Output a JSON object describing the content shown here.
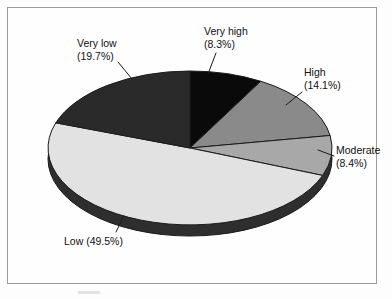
{
  "figure": {
    "background_color": "#fdfdfd",
    "frame_color": "#9a9a9a",
    "text_color": "#111111"
  },
  "chart_data": {
    "type": "pie",
    "title": "",
    "subtitle": "",
    "xlabel": "",
    "ylabel": "",
    "legend_position": "none",
    "grid": false,
    "three_d": true,
    "start_angle_deg": 90,
    "direction": "clockwise",
    "categories": [
      "Very high",
      "High",
      "Moderate",
      "Low",
      "Very low"
    ],
    "values": [
      8.3,
      14.1,
      8.4,
      49.5,
      19.7
    ],
    "value_unit": "%",
    "colors": [
      "#0a0a0a",
      "#8a8a8a",
      "#a8a8a8",
      "#e2e2e2",
      "#2a2a2a"
    ],
    "slices": [
      {
        "name": "Very high",
        "label_line1": "Very high",
        "label_line2": "(8.3%)",
        "value": 8.3,
        "color": "#0a0a0a",
        "start_angle_deg": 90,
        "sweep_deg": 29.88
      },
      {
        "name": "High",
        "label_line1": "High",
        "label_line2": "(14.1%)",
        "value": 14.1,
        "color": "#8a8a8a",
        "start_angle_deg": 60.12,
        "sweep_deg": 50.76
      },
      {
        "name": "Moderate",
        "label_line1": "Moderate",
        "label_line2": "(8.4%)",
        "value": 8.4,
        "color": "#a8a8a8",
        "start_angle_deg": 9.36,
        "sweep_deg": 30.24
      },
      {
        "name": "Low",
        "label_line1": "Low (49.5%)",
        "label_line2": "",
        "value": 49.5,
        "color": "#e2e2e2",
        "start_angle_deg": -20.88,
        "sweep_deg": 178.2
      },
      {
        "name": "Very low",
        "label_line1": "Very low",
        "label_line2": "(19.7%)",
        "value": 19.7,
        "color": "#2a2a2a",
        "start_angle_deg": -199.08,
        "sweep_deg": 70.92
      }
    ]
  }
}
